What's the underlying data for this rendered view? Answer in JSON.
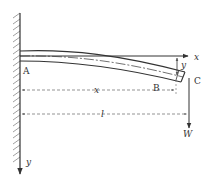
{
  "diagram": {
    "type": "cantilever-beam-deflection",
    "labels": {
      "fixed_end": "A",
      "section_point": "B",
      "free_end": "C",
      "x_axis": "x",
      "y_axis": "y",
      "deflection": "y",
      "position": "x",
      "length": "l",
      "load": "W"
    },
    "colors": {
      "stroke": "#333333",
      "dashed": "#666666",
      "hatch": "#888888",
      "background": "#ffffff"
    }
  }
}
